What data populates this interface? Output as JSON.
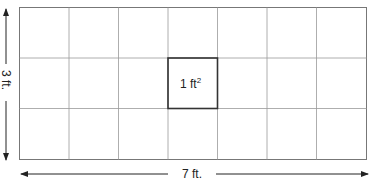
{
  "diagram": {
    "type": "area-grid",
    "columns": 7,
    "rows": 3,
    "highlighted_cell": {
      "column": 4,
      "row": 2,
      "label_base": "1 ft",
      "label_sup": "2"
    },
    "width_label": "7 ft.",
    "height_label": "3 ft.",
    "colors": {
      "grid_line": "#888888",
      "outer_border": "#777777",
      "highlight_border": "#333333",
      "arrow": "#222222",
      "text": "#222222"
    }
  }
}
